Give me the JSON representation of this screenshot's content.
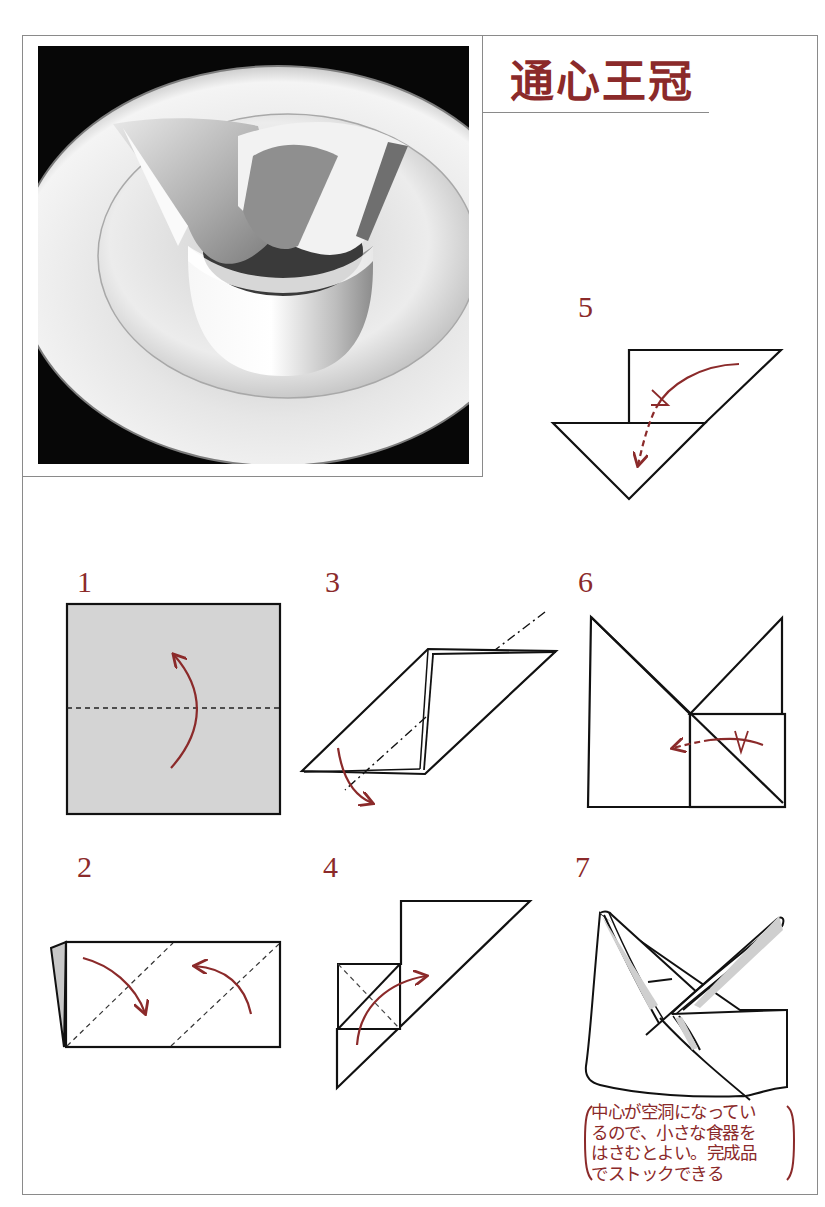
{
  "title": "通心王冠",
  "photo": {
    "alt": "folded napkin crown on plate"
  },
  "steps": [
    {
      "number": "1"
    },
    {
      "number": "2"
    },
    {
      "number": "3"
    },
    {
      "number": "4"
    },
    {
      "number": "5"
    },
    {
      "number": "6"
    },
    {
      "number": "7"
    }
  ],
  "note": {
    "lines": [
      "中心が空洞になってい",
      "るので、小さな食器を",
      "はさむとよい。完成品",
      "でストックできる"
    ]
  },
  "colors": {
    "accent": "#8b2a2a",
    "line": "#111111",
    "frame": "#8a8a8a",
    "napkin_fill": "#d4d4d4"
  }
}
